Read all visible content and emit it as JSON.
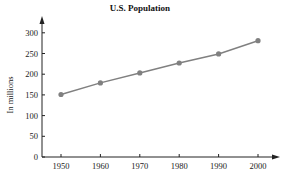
{
  "chart_data": {
    "type": "line",
    "title": "U.S. Population",
    "xlabel": "",
    "ylabel": "In millions",
    "categories": [
      "1950",
      "1960",
      "1970",
      "1980",
      "1990",
      "2000"
    ],
    "x": [
      1950,
      1960,
      1970,
      1980,
      1990,
      2000
    ],
    "series": [
      {
        "name": "U.S. Population",
        "values": [
          151,
          179,
          203,
          227,
          249,
          281
        ],
        "color": "#808080"
      }
    ],
    "yticks": [
      0,
      50,
      100,
      150,
      200,
      250,
      300
    ],
    "ylim": [
      0,
      340
    ],
    "grid": false,
    "legend": "none"
  }
}
